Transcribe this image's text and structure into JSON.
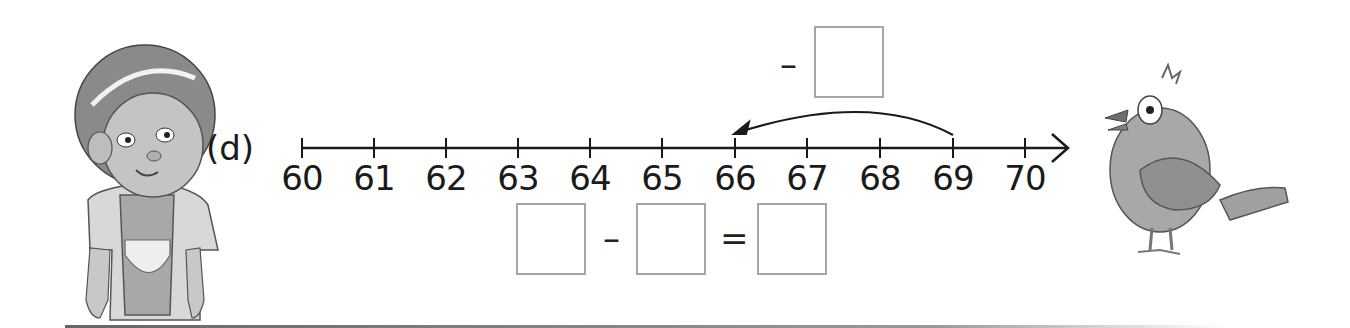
{
  "exercise": {
    "label": "(d)",
    "number_line": {
      "start": 60,
      "end": 70,
      "step": 1,
      "ticks": [
        "60",
        "61",
        "62",
        "63",
        "64",
        "65",
        "66",
        "67",
        "68",
        "69",
        "70"
      ]
    },
    "jump": {
      "from": 69,
      "to": 66,
      "direction": "left",
      "operator": "–",
      "box_value": ""
    },
    "equation": {
      "left_box": "",
      "operator": "–",
      "middle_box": "",
      "equals": "=",
      "result_box": ""
    }
  },
  "illustrations": {
    "left": "girl-with-apron",
    "right": "cartoon-bird"
  },
  "colors": {
    "line": "#1a1a1a",
    "box_border": "#a6a6a6",
    "figure_gray": "#9a9a9a",
    "background": "#ffffff"
  }
}
